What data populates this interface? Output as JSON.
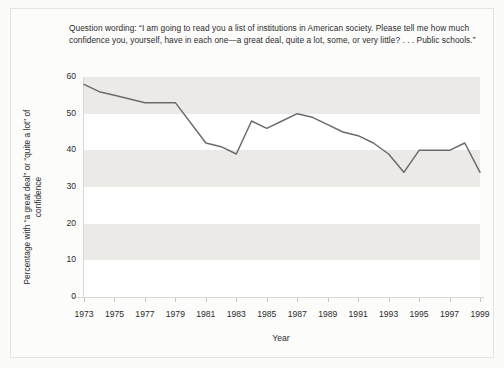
{
  "caption": {
    "text": "Question wording: “I am going to read you a list of institutions in American society. Please tell me how much confidence you, yourself, have in each one—a great deal, quite a lot, some, or very little? . . . Public schools.”"
  },
  "colors": {
    "line": "#6b6b6b",
    "band": "#eceae7",
    "plot_background": "#ffffff",
    "figure_background": "#fbfbfa",
    "text": "#2b2b2b",
    "axis": "#d8d6d2"
  },
  "chart_data": {
    "type": "line",
    "title": "",
    "subtitle": "",
    "xlabel": "Year",
    "ylabel": "Percentage with “a great deal” or “quite a lot” of confidence",
    "xlim": [
      1973,
      1999
    ],
    "ylim": [
      0,
      60
    ],
    "yticks": [
      0,
      10,
      20,
      30,
      40,
      50,
      60
    ],
    "xticks": [
      1973,
      1975,
      1977,
      1979,
      1981,
      1983,
      1985,
      1987,
      1989,
      1991,
      1993,
      1995,
      1997,
      1999
    ],
    "grid": false,
    "banded_background": true,
    "legend": null,
    "series": [
      {
        "name": "Public schools",
        "x": [
          1973,
          1974,
          1975,
          1976,
          1977,
          1979,
          1981,
          1982,
          1983,
          1984,
          1985,
          1986,
          1987,
          1988,
          1989,
          1990,
          1991,
          1992,
          1993,
          1994,
          1995,
          1996,
          1997,
          1998,
          1999
        ],
        "values": [
          58,
          56,
          55,
          54,
          53,
          53,
          42,
          41,
          39,
          48,
          46,
          48,
          50,
          49,
          47,
          45,
          44,
          42,
          39,
          34,
          40,
          40,
          40,
          42,
          34
        ]
      }
    ]
  }
}
